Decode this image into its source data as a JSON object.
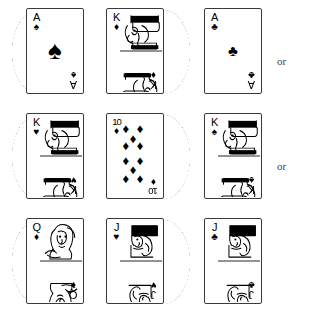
{
  "figure": {
    "width": 318,
    "height": 318,
    "background_color": "#ffffff",
    "ink_color": "#000000"
  },
  "glyphs": {
    "spade": "♠",
    "heart": "♥",
    "diamond": "♦",
    "club": "♣"
  },
  "connectors": [
    {
      "label": "or",
      "row": 0
    },
    {
      "label": "or",
      "row": 1
    }
  ],
  "rows": [
    {
      "name": "row-1",
      "connector": "or",
      "cards": [
        {
          "rank": "A",
          "suit": "spade",
          "suit_symbol": "♠",
          "label": "Ace of Spades",
          "type": "ace",
          "crescent": "left"
        },
        {
          "rank": "K",
          "suit": "diamond",
          "suit_symbol": "♦",
          "label": "King of Diamonds",
          "type": "court",
          "court": "king",
          "crescent": "right"
        },
        {
          "rank": "A",
          "suit": "club",
          "suit_symbol": "♣",
          "label": "Ace of Clubs",
          "type": "ace",
          "crescent": "none"
        }
      ]
    },
    {
      "name": "row-2",
      "connector": "or",
      "cards": [
        {
          "rank": "K",
          "suit": "heart",
          "suit_symbol": "♥",
          "label": "King of Hearts",
          "type": "court",
          "court": "king",
          "crescent": "left"
        },
        {
          "rank": "10",
          "suit": "diamond",
          "suit_symbol": "♦",
          "label": "Ten of Diamonds",
          "type": "spot",
          "pip_count": 10,
          "crescent": "right"
        },
        {
          "rank": "K",
          "suit": "spade",
          "suit_symbol": "♠",
          "label": "King of Spades",
          "type": "court",
          "court": "king",
          "crescent": "none"
        }
      ]
    },
    {
      "name": "row-3",
      "connector": "",
      "cards": [
        {
          "rank": "Q",
          "suit": "diamond",
          "suit_symbol": "♦",
          "label": "Queen of Diamonds",
          "type": "court",
          "court": "queen",
          "crescent": "left"
        },
        {
          "rank": "J",
          "suit": "heart",
          "suit_symbol": "♥",
          "label": "Jack of Hearts",
          "type": "court",
          "court": "jack",
          "crescent": "right"
        },
        {
          "rank": "J",
          "suit": "club",
          "suit_symbol": "♣",
          "label": "Jack of Clubs",
          "type": "court",
          "court": "jack",
          "crescent": "none"
        }
      ]
    }
  ]
}
